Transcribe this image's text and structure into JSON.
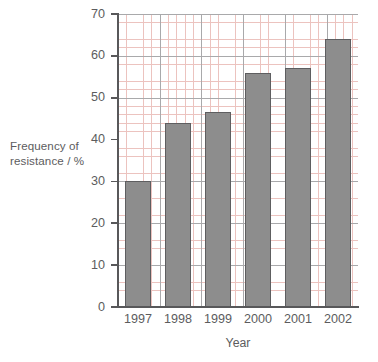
{
  "chart_data": {
    "type": "bar",
    "title": "",
    "categories": [
      "1997",
      "1998",
      "1999",
      "2000",
      "2001",
      "2002"
    ],
    "values": [
      30,
      44,
      46.5,
      56,
      57,
      64
    ],
    "xlabel": "Year",
    "ylabel": "Frequency of resistance / %",
    "ylim": [
      0,
      70
    ],
    "ytick_labels": [
      "0",
      "10",
      "20",
      "30",
      "40",
      "50",
      "60",
      "70"
    ],
    "ytick_values": [
      0,
      10,
      20,
      30,
      40,
      50,
      60,
      70
    ],
    "minor_tick_step": 2,
    "grid": "graph-paper, major every 10% and matching vertical, minor every 2%",
    "legend": "none",
    "series": [
      {
        "name": "Frequency of resistance",
        "values": [
          30,
          44,
          46.5,
          56,
          57,
          64
        ]
      }
    ],
    "colors": {
      "bar_fill": "#8d8d8d",
      "bar_outline": "#5e5e60",
      "axis": "#58585a",
      "grid_major": "#a9a9ab",
      "grid_minor": "#e9b9b4",
      "text": "#5c5c5e",
      "background": "#ffffff"
    }
  },
  "axis": {
    "ylabel_line1": "Frequency of",
    "ylabel_line2": "resistance / %",
    "xlabel": "Year"
  }
}
